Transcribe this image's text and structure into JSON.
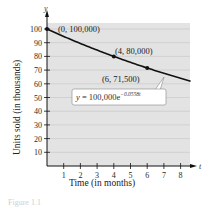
{
  "chart_data": {
    "type": "line",
    "title": "",
    "xlabel": "Time (in months)",
    "ylabel": "Units sold (in thousands)",
    "x_axis_letter": "t",
    "y_axis_letter": "y",
    "xlim": [
      0,
      8.6
    ],
    "ylim": [
      0,
      100
    ],
    "x_ticks": [
      1,
      2,
      3,
      4,
      5,
      6,
      7,
      8
    ],
    "y_ticks": [
      10,
      20,
      30,
      40,
      50,
      60,
      70,
      80,
      90,
      100
    ],
    "grid": true,
    "series": [
      {
        "name": "y = 100,000e^(-0.0558t)",
        "function": "100*exp(-0.0558*t)",
        "x": [
          0,
          1,
          2,
          3,
          4,
          5,
          6,
          7,
          8,
          8.6
        ],
        "values": [
          100,
          94.6,
          89.5,
          84.6,
          80.0,
          75.7,
          71.5,
          67.7,
          64.0,
          61.9
        ]
      }
    ],
    "points": [
      {
        "t": 0,
        "y": 100,
        "label": "(0, 100,000)"
      },
      {
        "t": 4,
        "y": 80,
        "label": "(4, 80,000)"
      },
      {
        "t": 6,
        "y": 71.5,
        "label": "(6, 71,500)"
      }
    ],
    "annotation": {
      "equation_main": "y = 100,000e",
      "equation_exponent": "−0.0558t"
    },
    "caption": "Figure 1.1"
  }
}
